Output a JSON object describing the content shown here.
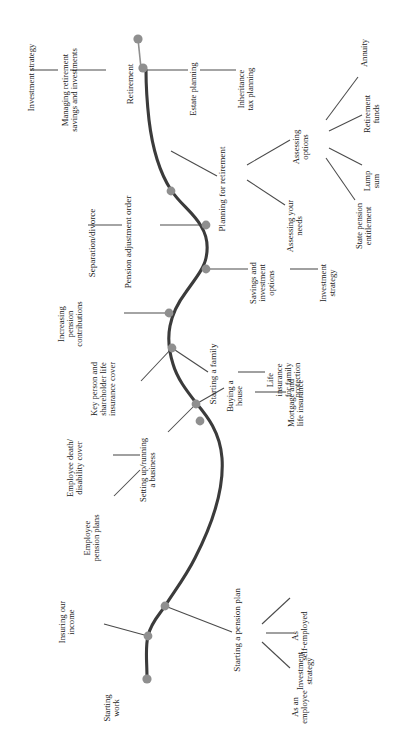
{
  "figure": {
    "title": "FINANCIAL PLANNING FOR LIFE EVENTS",
    "orientation": "rotated-90",
    "colors": {
      "spine": "#3b3b3b",
      "node": "#8f8f8f",
      "connector": "#4a4a4a",
      "text": "#1b1b1b",
      "background": "#ffffff"
    }
  },
  "milestones": [
    {
      "id": "starting-work",
      "label": "Starting\nwork"
    },
    {
      "id": "insuring-income",
      "label": "Insuring our\nincome"
    },
    {
      "id": "starting-pension",
      "label": "Starting a pension plan"
    },
    {
      "id": "setting-up-business",
      "label": "Setting up/running\na business"
    },
    {
      "id": "buying-house",
      "label": "Buying a\nhouse"
    },
    {
      "id": "starting-family",
      "label": "Starting a family"
    },
    {
      "id": "savings-investment",
      "label": "Savings and\ninvestment\noptions"
    },
    {
      "id": "increasing-pension",
      "label": "Increasing\npension\ncontributions"
    },
    {
      "id": "separation-divorce",
      "label": "Separation/divorce"
    },
    {
      "id": "planning-retirement",
      "label": "Planning for retirement"
    },
    {
      "id": "retirement",
      "label": "Retirement"
    }
  ],
  "branches": {
    "starting_pension": {
      "parent": "Starting a pension plan",
      "children": [
        "As an\nemployee",
        "Investment\nstrategy",
        "As\nself-employed"
      ]
    },
    "insuring_income": {
      "parent": "Insuring our\nincome",
      "children": []
    },
    "business": {
      "parent": "Setting up/running\na business",
      "children": [
        "Employee\npension plans",
        "Employee death/\ndisability cover",
        "Key person and\nshareholder life\ninsurance cover"
      ]
    },
    "buying_house": {
      "parent": "Buying a\nhouse",
      "children": [
        "Mortgage and\nlife insurance"
      ]
    },
    "starting_family": {
      "parent": "Starting a family",
      "children": [
        "Life\ninsurance\nfor family\nprotection"
      ]
    },
    "savings_investment": {
      "parent": "Savings and\ninvestment\noptions",
      "children": [
        "Investment\nstrategy"
      ]
    },
    "increasing_pension": {
      "parent": "Increasing\npension\ncontributions",
      "children": []
    },
    "separation": {
      "parent": "Separation/divorce",
      "children": [
        "Pension adjustment order"
      ]
    },
    "planning_retirement": {
      "parent": "Planning for retirement",
      "children": [
        "Assessing your\nneeds",
        "Assessing\noptions"
      ]
    },
    "assessing_options": {
      "parent": "Assessing\noptions",
      "children": [
        "State pension\nentitlement",
        "Lump\nsum",
        "Retirement\nfunds",
        "Annuity"
      ]
    },
    "retirement": {
      "parent": "Retirement",
      "children": [
        "Estate planning",
        "Inheritance\ntax planning",
        "Managing retirement\nsavings and investments",
        "Investment strategy"
      ]
    }
  },
  "labels": {
    "investment_strategy_top": "Investment strategy",
    "managing_retirement": "Managing retirement\nsavings and investments",
    "retirement": "Retirement",
    "estate_planning": "Estate planning",
    "inheritance_tax": "Inheritance\ntax planning",
    "planning_for_retirement": "Planning for retirement",
    "assessing_your_needs": "Assessing your\nneeds",
    "assessing_options": "Assessing\noptions",
    "state_pension": "State pension\nentitlement",
    "lump_sum": "Lump\nsum",
    "retirement_funds": "Retirement\nfunds",
    "annuity": "Annuity",
    "separation_divorce": "Separation/divorce",
    "pension_adjustment": "Pension adjustment order",
    "increasing_pension": "Increasing\npension\ncontributions",
    "savings_investment": "Savings and\ninvestment\noptions",
    "investment_strategy_mid": "Investment\nstrategy",
    "starting_family": "Starting a family",
    "life_insurance_family": "Life\ninsurance\nfor family\nprotection",
    "key_person": "Key person and\nshareholder life\ninsurance cover",
    "buying_house": "Buying a\nhouse",
    "mortgage_life": "Mortgage and\nlife insurance",
    "employee_death": "Employee death/\ndisability cover",
    "setting_up_business": "Setting up/running\na business",
    "employee_pension": "Employee\npension plans",
    "insuring_income": "Insuring our\nincome",
    "starting_pension_plan": "Starting a pension plan",
    "starting_work": "Starting\nwork",
    "as_an_employee": "As an\nemployee",
    "investment_strategy_bottom": "Investment\nstrategy",
    "as_self_employed": "As\nself-employed"
  }
}
